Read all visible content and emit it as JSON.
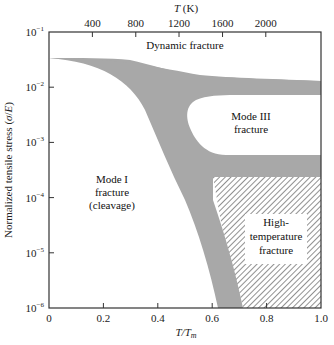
{
  "chart_data": {
    "type": "area",
    "title": "",
    "xlabel": "T/T_m",
    "xlabel_parts": {
      "base": "T/T",
      "sub": "m"
    },
    "ylabel": "Normalized tensile stress (σ/E)",
    "top_xlabel": "T (K)",
    "xlim": [
      0,
      1.0
    ],
    "ylim": [
      1e-06,
      0.1
    ],
    "yscale": "log",
    "x_ticks": [
      0,
      0.2,
      0.4,
      0.6,
      0.8,
      1.0
    ],
    "x_tick_labels": [
      "0",
      "0.2",
      "0.4",
      "0.6",
      "0.8",
      "1.0"
    ],
    "y_ticks": [
      0.1,
      0.01,
      0.001,
      0.0001,
      1e-05,
      1e-06
    ],
    "y_tick_labels": [
      {
        "base": "10",
        "exp": "−1"
      },
      {
        "base": "10",
        "exp": "−2"
      },
      {
        "base": "10",
        "exp": "−3"
      },
      {
        "base": "10",
        "exp": "−4"
      },
      {
        "base": "10",
        "exp": "−5"
      },
      {
        "base": "10",
        "exp": "−6"
      }
    ],
    "top_ticks_T_over_Tm": [
      0.1595,
      0.319,
      0.478,
      0.638,
      0.797
    ],
    "top_tick_labels": [
      "400",
      "800",
      "1200",
      "1600",
      "2000"
    ],
    "grid": false,
    "regions": [
      {
        "name": "Dynamic fracture",
        "label": [
          "Dynamic fracture"
        ]
      },
      {
        "name": "Mode III fracture",
        "label": [
          "Mode III",
          "fracture"
        ]
      },
      {
        "name": "Mode I fracture (cleavage)",
        "label": [
          "Mode I",
          "fracture",
          "(cleavage)"
        ]
      },
      {
        "name": "High-temperature fracture",
        "label": [
          "High-",
          "temperature",
          "fracture"
        ]
      }
    ],
    "transition_band": {
      "description": "Gray transition band separating fracture regimes",
      "upper_edge": [
        [
          0,
          0.032
        ],
        [
          0.2,
          0.026
        ],
        [
          0.35,
          0.016
        ],
        [
          0.45,
          0.009
        ],
        [
          0.52,
          0.006
        ],
        [
          0.6,
          0.0045
        ],
        [
          0.7,
          0.0045
        ],
        [
          0.85,
          0.0048
        ],
        [
          1.0,
          0.005
        ]
      ],
      "upper_lower_edge": [
        [
          0,
          0.032
        ],
        [
          0.2,
          0.022
        ],
        [
          0.32,
          0.009
        ],
        [
          0.4,
          0.0025
        ],
        [
          0.47,
          0.0007
        ],
        [
          0.52,
          0.00045
        ],
        [
          0.58,
          0.00033
        ],
        [
          0.7,
          0.00026
        ],
        [
          1.0,
          0.00025
        ]
      ],
      "mode3_upper": [
        [
          0.58,
          0.0047
        ],
        [
          0.62,
          0.0052
        ],
        [
          0.8,
          0.006
        ],
        [
          1.0,
          0.0062
        ]
      ],
      "lower_band_top": [
        [
          0.62,
          0.00055
        ],
        [
          1.0,
          0.00055
        ]
      ],
      "lower_band_bottom": [
        [
          0.62,
          0.00022
        ],
        [
          1.0,
          0.00022
        ]
      ],
      "left_edge_bottom": [
        [
          0.43,
          0.0007
        ],
        [
          0.5,
          8e-05
        ],
        [
          0.56,
          1e-05
        ],
        [
          0.62,
          1e-06
        ]
      ],
      "right_edge_bottom": [
        [
          0.57,
          0.00022
        ],
        [
          0.6,
          5e-05
        ],
        [
          0.66,
          8e-06
        ],
        [
          0.71,
          1e-06
        ]
      ]
    },
    "colors": {
      "band": "#a9a9a9",
      "hatch": "#555555",
      "axis": "#333333"
    }
  }
}
